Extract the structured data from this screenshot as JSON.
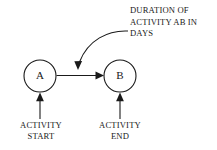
{
  "diagram": {
    "background_color": "#ffffff",
    "line_color": "#1a1a1a",
    "nodes": [
      {
        "id": "A",
        "label": "A",
        "cx": 40,
        "cy": 76,
        "r": 16
      },
      {
        "id": "B",
        "label": "B",
        "cx": 120,
        "cy": 76,
        "r": 16
      }
    ],
    "annotation": {
      "lines": [
        "DURATION OF",
        "ACTIVITY AB IN",
        "DAYS"
      ],
      "line1": "DURATION OF",
      "line2": "ACTIVITY AB IN",
      "line3": "DAYS"
    },
    "captions": [
      {
        "id": "start",
        "line1": "ACTIVITY",
        "line2": "START"
      },
      {
        "id": "end",
        "line1": "ACTIVITY",
        "line2": "END"
      }
    ],
    "caption_start": {
      "line1": "ACTIVITY",
      "line2": "START"
    },
    "caption_end": {
      "line1": "ACTIVITY",
      "line2": "END"
    },
    "edges": [
      {
        "from": "A",
        "to": "B",
        "kind": "activity-arrow",
        "direction": "right"
      },
      {
        "from": "annotation",
        "to": "activity-arrow",
        "kind": "leader-curve",
        "direction": "down"
      },
      {
        "from": "caption-start",
        "to": "A",
        "kind": "pointer",
        "direction": "up"
      },
      {
        "from": "caption-end",
        "to": "B",
        "kind": "pointer",
        "direction": "up"
      }
    ]
  }
}
